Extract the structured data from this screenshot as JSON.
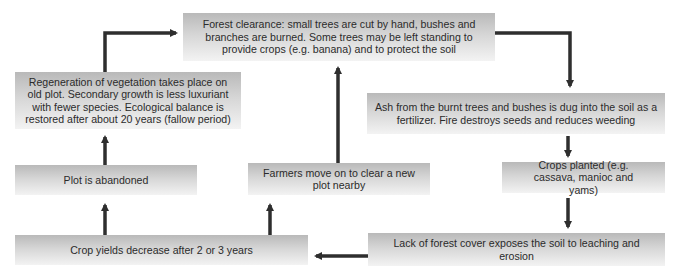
{
  "diagram": {
    "colors": {
      "box_top": "#b9b9b9",
      "box_bottom": "#f3f3f3",
      "arrow": "#2e2e2e",
      "text": "#2b2b2b"
    },
    "nodes": {
      "forest_clearance": "Forest clearance: small trees are cut by hand, bushes and branches are burned. Some trees may be left standing to provide crops (e.g. banana) and to protect the soil",
      "ash": "Ash from the burnt trees and bushes is dug into the soil as a fertilizer. Fire destroys seeds and reduces weeding",
      "crops_planted": "Crops planted (e.g. cassava, manioc and yams)",
      "lack_of_cover": "Lack of forest cover exposes the soil to leaching and erosion",
      "crop_yields": "Crop yields decrease after 2 or 3 years",
      "plot_abandoned": "Plot is abandoned",
      "farmers_move": "Farmers move on to clear a new plot nearby",
      "regeneration": "Regeneration of vegetation takes place on old plot. Secondary growth is less luxuriant with fewer species. Ecological balance is restored after about 20 years (fallow period)"
    },
    "edges": [
      {
        "from": "forest_clearance",
        "to": "ash"
      },
      {
        "from": "ash",
        "to": "crops_planted"
      },
      {
        "from": "crops_planted",
        "to": "lack_of_cover"
      },
      {
        "from": "lack_of_cover",
        "to": "crop_yields"
      },
      {
        "from": "crop_yields",
        "to": "plot_abandoned"
      },
      {
        "from": "crop_yields",
        "to": "farmers_move"
      },
      {
        "from": "plot_abandoned",
        "to": "regeneration"
      },
      {
        "from": "regeneration",
        "to": "forest_clearance"
      },
      {
        "from": "farmers_move",
        "to": "forest_clearance"
      }
    ]
  }
}
